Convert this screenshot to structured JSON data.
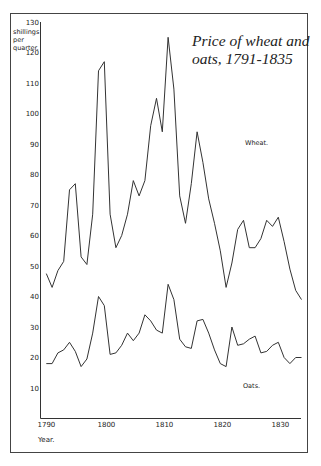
{
  "chart_data": {
    "type": "line",
    "title": "Price of wheat and oats, 1791-1835",
    "title_lines": [
      "Price of wheat and",
      "oats, 1791-1835"
    ],
    "xlabel": "Year.",
    "ylabel_lines": [
      "shillings",
      "per",
      "quarter."
    ],
    "ylabel": "shillings per quarter.",
    "xlim": [
      1790,
      1835
    ],
    "ylim": [
      0,
      130
    ],
    "x_ticks": [
      1790,
      1800,
      1810,
      1820,
      1830
    ],
    "x_tick_labels": [
      "1790",
      "1800",
      "1810",
      "1820",
      "1830"
    ],
    "y_ticks": [
      10,
      20,
      30,
      40,
      50,
      60,
      70,
      80,
      90,
      100,
      110,
      120,
      130
    ],
    "y_tick_labels": [
      "10",
      "20",
      "30",
      "40",
      "50",
      "60",
      "70",
      "80",
      "90",
      "100",
      "110",
      "120",
      "130"
    ],
    "grid": false,
    "legend": "inline labels",
    "x": [
      1791,
      1792,
      1793,
      1794,
      1795,
      1796,
      1797,
      1798,
      1799,
      1800,
      1801,
      1802,
      1803,
      1804,
      1805,
      1806,
      1807,
      1808,
      1809,
      1810,
      1811,
      1812,
      1813,
      1814,
      1815,
      1816,
      1817,
      1818,
      1819,
      1820,
      1821,
      1822,
      1823,
      1824,
      1825,
      1826,
      1827,
      1828,
      1829,
      1830,
      1831,
      1832,
      1833,
      1834,
      1835
    ],
    "series": [
      {
        "name": "Wheat.",
        "values": [
          47.5,
          43,
          48.5,
          51.5,
          75,
          77,
          53,
          50.5,
          67,
          114,
          117,
          67,
          56,
          60,
          67,
          78,
          73,
          78,
          96,
          105,
          94,
          125,
          108,
          73,
          64,
          77,
          94,
          84,
          72,
          64,
          55,
          43,
          51,
          62,
          65,
          56,
          56,
          59,
          65,
          63,
          66,
          58,
          49,
          42,
          39
        ]
      },
      {
        "name": "Oats.",
        "values": [
          18,
          18,
          21.5,
          22.5,
          25,
          22,
          17,
          19.5,
          28,
          40,
          37,
          21,
          21.5,
          24,
          28,
          25.5,
          28,
          34,
          32,
          29,
          28,
          44,
          39,
          26,
          23.5,
          23,
          32,
          32.5,
          28,
          22.5,
          18,
          17,
          30,
          24,
          24.5,
          26,
          27,
          21.5,
          22,
          24,
          25,
          20,
          18,
          20,
          20
        ]
      }
    ]
  },
  "labels": {
    "wheat": "Wheat.",
    "oats": "Oats."
  }
}
